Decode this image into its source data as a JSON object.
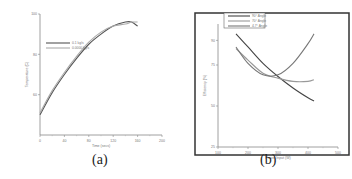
{
  "captions": {
    "a": "(a)",
    "b": "(b)"
  },
  "chart_data": [
    {
      "type": "line",
      "title": "",
      "panel": "(a)",
      "xlabel": "Time (secs)",
      "ylabel": "Temperature (C)",
      "xlim": [
        0,
        200
      ],
      "ylim": [
        40,
        100
      ],
      "x_ticks": [
        "0",
        "40",
        "80",
        "120",
        "160",
        "200"
      ],
      "y_ticks": [
        "60",
        "80",
        "100"
      ],
      "grid": false,
      "legend_position": "upper-left",
      "x": [
        0,
        20,
        40,
        60,
        80,
        100,
        120,
        140,
        150,
        160
      ],
      "series": [
        {
          "name": "0.1 kg/s",
          "color": "#555555",
          "values": [
            50,
            61,
            70,
            78,
            85,
            90,
            94,
            96,
            96,
            94
          ]
        },
        {
          "name": "0.0000 kg/s",
          "color": "#aaaaaa",
          "values": [
            51,
            62,
            71,
            79,
            86,
            91,
            94,
            95,
            96,
            96
          ]
        }
      ]
    },
    {
      "type": "line",
      "title": "",
      "panel": "(b)",
      "xlabel": "Power Input (W)",
      "ylabel": "Efficiency (%)",
      "xlim": [
        100,
        500
      ],
      "ylim": [
        25,
        100
      ],
      "x_ticks": [
        "100",
        "200",
        "300",
        "400",
        "500"
      ],
      "y_ticks": [
        "25",
        "50",
        "75",
        "90"
      ],
      "grid": false,
      "legend_position": "top",
      "x": [
        160,
        200,
        250,
        300,
        350,
        400,
        420
      ],
      "series": [
        {
          "name": "90° Angle",
          "color": "#444444",
          "values": [
            94,
            86,
            76,
            68,
            61,
            55,
            53
          ]
        },
        {
          "name": "70° Angle",
          "color": "#999999",
          "values": [
            85,
            78,
            70,
            67,
            65,
            65,
            66
          ]
        },
        {
          "name": "4.7° Angle",
          "color": "#777777",
          "values": [
            86,
            76,
            69,
            69,
            76,
            88,
            94
          ]
        }
      ]
    }
  ]
}
